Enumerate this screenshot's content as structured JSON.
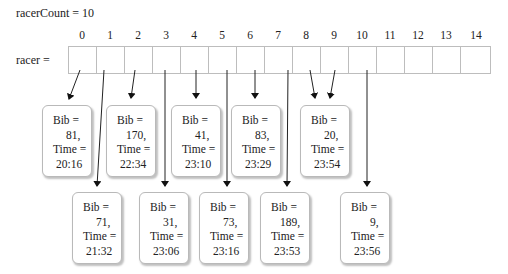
{
  "racer_count": {
    "label": "racerCount = 10"
  },
  "array": {
    "label": "racer =",
    "indices": [
      "0",
      "1",
      "2",
      "3",
      "4",
      "5",
      "6",
      "7",
      "8",
      "9",
      "10",
      "11",
      "12",
      "13",
      "14"
    ]
  },
  "records_top": [
    {
      "bib_label": "Bib =",
      "bib": "81,",
      "time_label": "Time =",
      "time": "20:16",
      "index": 0
    },
    {
      "bib_label": "Bib =",
      "bib": "170,",
      "time_label": "Time =",
      "time": "22:34",
      "index": 2
    },
    {
      "bib_label": "Bib =",
      "bib": "41,",
      "time_label": "Time =",
      "time": "23:10",
      "index": 4
    },
    {
      "bib_label": "Bib =",
      "bib": "83,",
      "time_label": "Time =",
      "time": "23:29",
      "index": 6
    },
    {
      "bib_label": "Bib =",
      "bib": "20,",
      "time_label": "Time =",
      "time": "23:54",
      "index": 9
    }
  ],
  "records_bottom": [
    {
      "bib_label": "Bib =",
      "bib": "71,",
      "time_label": "Time =",
      "time": "21:32",
      "index": 1
    },
    {
      "bib_label": "Bib =",
      "bib": "31,",
      "time_label": "Time =",
      "time": "23:06",
      "index": 3
    },
    {
      "bib_label": "Bib =",
      "bib": "73,",
      "time_label": "Time =",
      "time": "23:16",
      "index": 5
    },
    {
      "bib_label": "Bib =",
      "bib": "189,",
      "time_label": "Time =",
      "time": "23:53",
      "index": 7
    },
    {
      "bib_label": "Bib =",
      "bib": "9,",
      "time_label": "Time =",
      "time": "23:56",
      "index": 10
    }
  ],
  "notes": {
    "array_length": 15,
    "duplicate_pointers": "indices 8 and 9 both point to Bib 20 record"
  }
}
